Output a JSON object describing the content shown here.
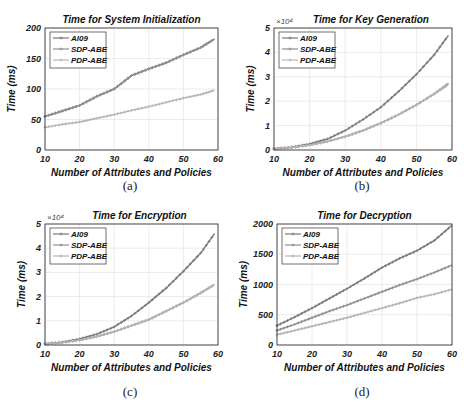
{
  "figure": {
    "captions": [
      "(a)",
      "(b)",
      "(c)",
      "(d)"
    ]
  },
  "colors": {
    "AI09": "#7a7a7a",
    "SDP-ABE": "#8f8f8f",
    "PDP-ABE": "#b5b5b5",
    "grid": "#dedede",
    "axis": "#222222"
  },
  "chart_data": [
    {
      "id": "a",
      "type": "line",
      "title": "Time for System Initialization",
      "xlabel": "Number of Attributes and Policies",
      "ylabel": "Time (ms)",
      "xlim": [
        10,
        60
      ],
      "ylim": [
        0,
        200
      ],
      "xticks": [
        10,
        20,
        30,
        40,
        50,
        60
      ],
      "yticks": [
        0,
        50,
        100,
        150,
        200
      ],
      "yexponent": "",
      "grid": true,
      "legend_position": "upper left",
      "x": [
        10,
        15,
        20,
        25,
        30,
        35,
        40,
        45,
        50,
        55,
        59
      ],
      "series": [
        {
          "name": "AI09",
          "values": [
            55,
            64,
            73,
            88,
            100,
            122,
            133,
            143,
            156,
            168,
            182
          ]
        },
        {
          "name": "SDP-ABE",
          "values": [
            55,
            64,
            73,
            88,
            100,
            122,
            133,
            143,
            156,
            168,
            182
          ]
        },
        {
          "name": "PDP-ABE",
          "values": [
            37,
            42,
            46,
            52,
            58,
            65,
            71,
            78,
            85,
            91,
            98
          ]
        }
      ]
    },
    {
      "id": "b",
      "type": "line",
      "title": "Time for Key Generation",
      "xlabel": "Number of Attributes and Policies",
      "ylabel": "Time (ms)",
      "xlim": [
        10,
        60
      ],
      "ylim": [
        0,
        5
      ],
      "xticks": [
        10,
        20,
        30,
        40,
        50,
        60
      ],
      "yticks": [
        0,
        1,
        2,
        3,
        4,
        5
      ],
      "yexponent": "×10⁴",
      "grid": true,
      "legend_position": "upper left",
      "x": [
        10,
        15,
        20,
        25,
        30,
        35,
        40,
        45,
        50,
        55,
        59
      ],
      "series": [
        {
          "name": "AI09",
          "values": [
            0.05,
            0.12,
            0.25,
            0.45,
            0.8,
            1.25,
            1.75,
            2.4,
            3.1,
            3.9,
            4.7
          ]
        },
        {
          "name": "SDP-ABE",
          "values": [
            0.05,
            0.1,
            0.2,
            0.35,
            0.55,
            0.8,
            1.1,
            1.45,
            1.85,
            2.3,
            2.7
          ]
        },
        {
          "name": "PDP-ABE",
          "values": [
            0.05,
            0.1,
            0.2,
            0.35,
            0.55,
            0.8,
            1.1,
            1.45,
            1.85,
            2.3,
            2.75
          ]
        }
      ]
    },
    {
      "id": "c",
      "type": "line",
      "title": "Time for Encryption",
      "xlabel": "Number of Attributes and Policies",
      "ylabel": "Time (ms)",
      "xlim": [
        10,
        60
      ],
      "ylim": [
        0,
        5
      ],
      "xticks": [
        10,
        20,
        30,
        40,
        50,
        60
      ],
      "yticks": [
        0,
        1,
        2,
        3,
        4,
        5
      ],
      "yexponent": "×10⁴",
      "grid": true,
      "legend_position": "upper left",
      "x": [
        10,
        15,
        20,
        25,
        30,
        35,
        40,
        45,
        50,
        55,
        59
      ],
      "series": [
        {
          "name": "AI09",
          "values": [
            0.05,
            0.12,
            0.25,
            0.45,
            0.75,
            1.2,
            1.75,
            2.35,
            3.05,
            3.8,
            4.6
          ]
        },
        {
          "name": "SDP-ABE",
          "values": [
            0.05,
            0.1,
            0.2,
            0.35,
            0.55,
            0.8,
            1.05,
            1.4,
            1.75,
            2.15,
            2.5
          ]
        },
        {
          "name": "PDP-ABE",
          "values": [
            0.05,
            0.1,
            0.2,
            0.35,
            0.55,
            0.8,
            1.05,
            1.4,
            1.75,
            2.15,
            2.5
          ]
        }
      ]
    },
    {
      "id": "d",
      "type": "line",
      "title": "Time for Decryption",
      "xlabel": "Number of Attributes and Policies",
      "ylabel": "Time (ms)",
      "xlim": [
        10,
        60
      ],
      "ylim": [
        0,
        2000
      ],
      "xticks": [
        10,
        20,
        30,
        40,
        50,
        60
      ],
      "yticks": [
        0,
        500,
        1000,
        1500,
        2000
      ],
      "yexponent": "",
      "grid": true,
      "legend_position": "upper left",
      "x": [
        10,
        15,
        20,
        25,
        30,
        35,
        40,
        45,
        50,
        55,
        60
      ],
      "series": [
        {
          "name": "AI09",
          "values": [
            320,
            460,
            610,
            770,
            930,
            1100,
            1280,
            1430,
            1560,
            1730,
            1980
          ]
        },
        {
          "name": "SDP-ABE",
          "values": [
            240,
            340,
            450,
            560,
            660,
            770,
            880,
            990,
            1090,
            1200,
            1320
          ]
        },
        {
          "name": "PDP-ABE",
          "values": [
            170,
            240,
            310,
            380,
            450,
            530,
            610,
            690,
            780,
            840,
            920
          ]
        }
      ]
    }
  ]
}
